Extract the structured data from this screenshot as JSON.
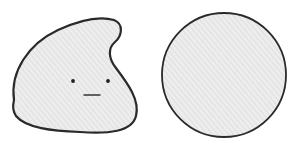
{
  "scene": {
    "description": "Pencil sketch of a blob-shaped character with a face next to a plain circle",
    "background": "#ffffff",
    "stroke_color": "#2a2a2a",
    "fill_color": "#ececec",
    "hatch_color": "#d4d4d4"
  },
  "figures": [
    {
      "name": "blob-character",
      "shape": "irregular blob with a curled top-right lobe",
      "face": {
        "eyes": 2,
        "mouth": "short horizontal line",
        "expression": "neutral"
      }
    },
    {
      "name": "circle",
      "shape": "circle",
      "face": null
    }
  ]
}
